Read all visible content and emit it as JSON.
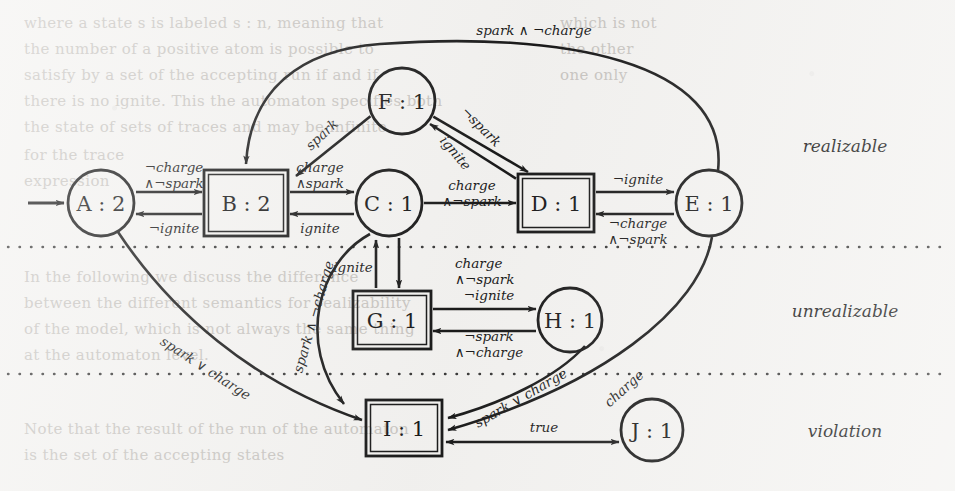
{
  "figure": {
    "type": "state-transition-diagram",
    "background_color": "#f4f3f1",
    "ink_color": "#1a1a1a"
  },
  "zones": [
    {
      "id": "realizable",
      "label": "realizable",
      "label_x": 845,
      "label_y": 152
    },
    {
      "id": "unrealizable",
      "label": "unrealizable",
      "label_x": 845,
      "label_y": 317
    },
    {
      "id": "violation",
      "label": "violation",
      "label_x": 845,
      "label_y": 437
    }
  ],
  "separators": [
    {
      "id": "sep-realizable-unrealizable",
      "y": 247,
      "x1": 8,
      "x2": 948
    },
    {
      "id": "sep-unrealizable-violation",
      "y": 374,
      "x1": 8,
      "x2": 948
    }
  ],
  "nodes": [
    {
      "id": "A",
      "label": "A : 2",
      "shape": "circle",
      "cx": 101,
      "cy": 203,
      "r": 33,
      "zone": "realizable"
    },
    {
      "id": "B",
      "label": "B : 2",
      "shape": "box",
      "cx": 246,
      "cy": 203,
      "w": 84,
      "h": 66,
      "zone": "realizable"
    },
    {
      "id": "C",
      "label": "C : 1",
      "shape": "circle",
      "cx": 389,
      "cy": 203,
      "r": 33,
      "zone": "realizable"
    },
    {
      "id": "D",
      "label": "D : 1",
      "shape": "box",
      "cx": 556,
      "cy": 203,
      "w": 76,
      "h": 58,
      "zone": "realizable"
    },
    {
      "id": "E",
      "label": "E : 1",
      "shape": "circle",
      "cx": 709,
      "cy": 203,
      "r": 33,
      "zone": "realizable"
    },
    {
      "id": "F",
      "label": "F : 1",
      "shape": "circle",
      "cx": 402,
      "cy": 101,
      "r": 33,
      "zone": "realizable"
    },
    {
      "id": "G",
      "label": "G : 1",
      "shape": "box",
      "cx": 392,
      "cy": 320,
      "w": 78,
      "h": 58,
      "zone": "unrealizable"
    },
    {
      "id": "H",
      "label": "H : 1",
      "shape": "circle",
      "cx": 570,
      "cy": 320,
      "r": 32,
      "zone": "unrealizable"
    },
    {
      "id": "I",
      "label": "I : 1",
      "shape": "box",
      "cx": 404,
      "cy": 428,
      "w": 76,
      "h": 56,
      "zone": "violation"
    },
    {
      "id": "J",
      "label": "J : 1",
      "shape": "circle",
      "cx": 652,
      "cy": 430,
      "r": 31,
      "zone": "violation"
    }
  ],
  "initial_arrow": {
    "id": "initial",
    "from_x": 28,
    "to_x": 64,
    "y": 203
  },
  "edges": [
    {
      "id": "A-B",
      "from": "A",
      "to": "B",
      "label": "¬hargeᵃ",
      "label_lines": [
        "¬charge",
        "∧¬spark"
      ],
      "label_x": 174,
      "label_y": 172,
      "align": "middle"
    },
    {
      "id": "B-A",
      "from": "B",
      "to": "A",
      "label_lines": [
        "¬ignite"
      ],
      "label_x": 174,
      "label_y": 233,
      "align": "middle"
    },
    {
      "id": "C-B",
      "from": "C",
      "to": "B",
      "label_lines": [
        "charge",
        "∧spark"
      ],
      "label_x": 320,
      "label_y": 172,
      "align": "middle"
    },
    {
      "id": "B-C",
      "from": "B",
      "to": "C",
      "label_lines": [
        "ignite"
      ],
      "label_x": 320,
      "label_y": 233,
      "align": "middle"
    },
    {
      "id": "C-D",
      "from": "C",
      "to": "D",
      "label_lines": [
        "charge",
        "∧¬spark"
      ],
      "label_x": 472,
      "label_y": 190,
      "align": "middle"
    },
    {
      "id": "D-E",
      "from": "D",
      "to": "E",
      "label_lines": [
        "¬ignite"
      ],
      "label_x": 638,
      "label_y": 184,
      "align": "middle"
    },
    {
      "id": "E-D",
      "from": "E",
      "to": "D",
      "label_lines": [
        "¬charge",
        "∧¬spark"
      ],
      "label_x": 638,
      "label_y": 228,
      "align": "middle"
    },
    {
      "id": "F-B",
      "from": "F",
      "to": "B",
      "label_lines": [
        "spark"
      ],
      "label_x": 325,
      "label_y": 138,
      "rotate": -43,
      "align": "middle"
    },
    {
      "id": "F-D",
      "from": "F",
      "to": "D",
      "label_lines": [
        "¬spark"
      ],
      "label_x": 478,
      "label_y": 130,
      "rotate": 45,
      "align": "middle"
    },
    {
      "id": "D-F",
      "from": "D",
      "to": "F",
      "label_lines": [
        "ignite"
      ],
      "label_x": 452,
      "label_y": 156,
      "rotate": 50,
      "align": "middle"
    },
    {
      "id": "E-B",
      "from": "E",
      "to": "B",
      "label_lines": [
        "spark ∧ ¬charge"
      ],
      "label_x": 534,
      "label_y": 35,
      "align": "middle"
    },
    {
      "id": "C-G",
      "from": "C",
      "to": "G",
      "label_lines": [
        "charge",
        "∧¬spark"
      ],
      "label_x": 455,
      "label_y": 268,
      "align": "start"
    },
    {
      "id": "G-C",
      "from": "G",
      "to": "C",
      "label_lines": [
        "ignite"
      ],
      "label_x": 353,
      "label_y": 272,
      "align": "middle"
    },
    {
      "id": "G-H",
      "from": "G",
      "to": "H",
      "label_lines": [
        "¬ignite"
      ],
      "label_x": 489,
      "label_y": 300,
      "align": "middle"
    },
    {
      "id": "H-G",
      "from": "H",
      "to": "G",
      "label_lines": [
        "¬spark",
        "∧¬charge"
      ],
      "label_x": 489,
      "label_y": 341,
      "align": "middle"
    },
    {
      "id": "A-I",
      "from": "A",
      "to": "I",
      "label_lines": [
        "spark ∨ charge"
      ],
      "label_x": 203,
      "label_y": 372,
      "rotate": 33,
      "align": "middle"
    },
    {
      "id": "C-I",
      "from": "C",
      "to": "I",
      "label_lines": [
        "spark ∧ ¬charge"
      ],
      "label_x": 318,
      "label_y": 318,
      "rotate": -74,
      "align": "middle"
    },
    {
      "id": "H-I",
      "from": "H",
      "to": "I",
      "label_lines": [
        "spark ∨ charge"
      ],
      "label_x": 523,
      "label_y": 402,
      "rotate": -30,
      "align": "middle"
    },
    {
      "id": "E-I",
      "from": "E",
      "to": "I",
      "label_lines": [
        "charge"
      ],
      "label_x": 627,
      "label_y": 392,
      "rotate": -42,
      "align": "middle"
    },
    {
      "id": "I-J",
      "from": "I",
      "to": "J",
      "label_lines": [
        "true"
      ],
      "label_x": 544,
      "label_y": 432,
      "align": "middle",
      "bidirectional": true
    }
  ],
  "ghost_text": [
    {
      "text": "where a state s is labeled s : n, meaning that",
      "x": 24,
      "y": 14
    },
    {
      "text": "the number of a positive atom is possible to",
      "x": 24,
      "y": 40
    },
    {
      "text": "satisfy by a set of the accepting run if and if",
      "x": 24,
      "y": 66
    },
    {
      "text": "there is no ignite. This the automaton specifies both",
      "x": 24,
      "y": 92
    },
    {
      "text": "the state of sets of traces and may be infinite",
      "x": 24,
      "y": 118
    },
    {
      "text": "for the trace",
      "x": 24,
      "y": 146
    },
    {
      "text": "expression",
      "x": 24,
      "y": 172
    },
    {
      "text": "In the following we discuss the difference",
      "x": 24,
      "y": 268
    },
    {
      "text": "between the different semantics for realizability",
      "x": 24,
      "y": 294
    },
    {
      "text": "of the model, which is not always the same thing",
      "x": 24,
      "y": 320
    },
    {
      "text": "at the automaton level.",
      "x": 24,
      "y": 346
    },
    {
      "text": "Note that the result of the run of the automaton",
      "x": 24,
      "y": 420
    },
    {
      "text": "is the set of the accepting states",
      "x": 24,
      "y": 446
    },
    {
      "text": "which is not",
      "x": 560,
      "y": 14
    },
    {
      "text": "the other",
      "x": 560,
      "y": 40
    },
    {
      "text": "one only",
      "x": 560,
      "y": 66
    }
  ]
}
